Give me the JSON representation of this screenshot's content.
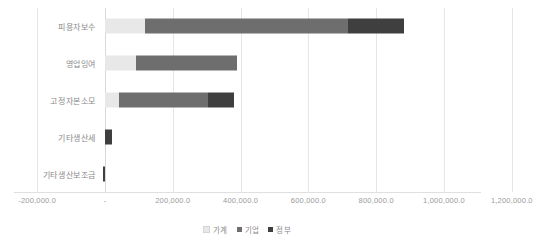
{
  "chart_data": {
    "type": "bar",
    "orientation": "horizontal",
    "stacked": true,
    "title": "",
    "xlabel": "",
    "ylabel": "",
    "categories": [
      "피용자보수",
      "영업잉여",
      "고정자본소모",
      "기타생산세",
      "기타생산보조금"
    ],
    "series": [
      {
        "name": "가계",
        "color": "#e8e8e8",
        "values": [
          118000.0,
          91000.0,
          41000.0,
          0.0,
          0.0
        ]
      },
      {
        "name": "기업",
        "color": "#6e6e6e",
        "values": [
          600000.0,
          297000.0,
          262000.0,
          0.0,
          0.0
        ]
      },
      {
        "name": "정부",
        "color": "#3f3f3f",
        "values": [
          165000.0,
          0.0,
          79000.0,
          20000.0,
          -6000.0
        ]
      }
    ],
    "xlim": [
      -200000.0,
      1200000.0
    ],
    "xticks": [
      -200000.0,
      0.0,
      200000.0,
      400000.0,
      600000.0,
      800000.0,
      1000000.0,
      1200000.0
    ],
    "xtick_labels": [
      "-200,000.0",
      "-",
      "200,000.0",
      "400,000.0",
      "600,000.0",
      "800,000.0",
      "1,000,000.0",
      "1,200,000.0"
    ],
    "grid": true,
    "legend_position": "bottom"
  },
  "legend": {
    "items": [
      {
        "label": "가계",
        "color": "#e8e8e8"
      },
      {
        "label": "기업",
        "color": "#6e6e6e"
      },
      {
        "label": "정부",
        "color": "#3f3f3f"
      }
    ]
  }
}
